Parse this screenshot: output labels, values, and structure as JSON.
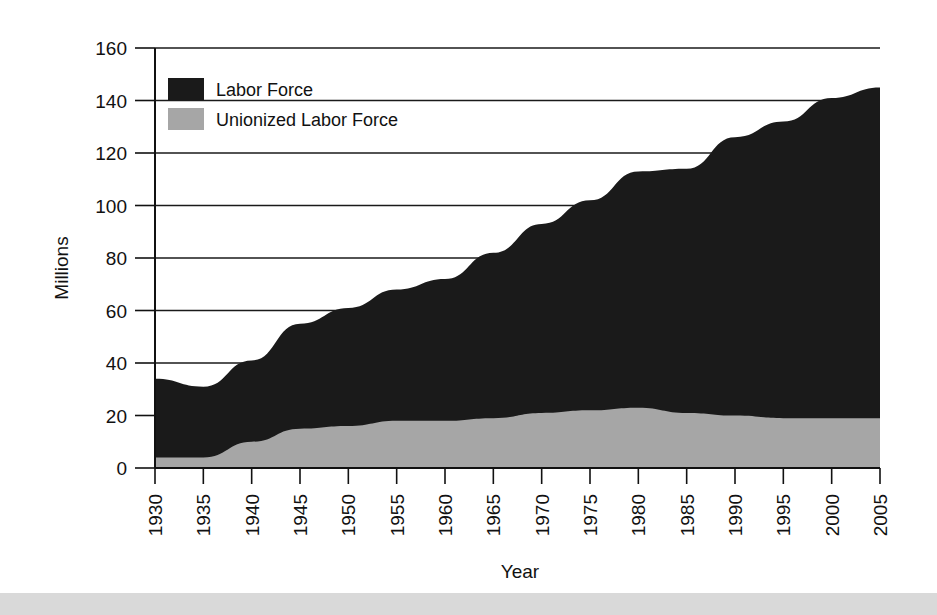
{
  "chart_data": {
    "type": "area",
    "title": "",
    "xlabel": "Year",
    "ylabel": "Millions",
    "x": [
      1930,
      1935,
      1940,
      1945,
      1950,
      1955,
      1960,
      1965,
      1970,
      1975,
      1980,
      1985,
      1990,
      1995,
      2000,
      2005
    ],
    "categories": [
      "1930",
      "1935",
      "1940",
      "1945",
      "1950",
      "1955",
      "1960",
      "1965",
      "1970",
      "1975",
      "1980",
      "1985",
      "1990",
      "1995",
      "2000",
      "2005"
    ],
    "series": [
      {
        "name": "Labor Force",
        "color": "#1a1a1a",
        "values": [
          34,
          31,
          41,
          55,
          61,
          68,
          72,
          82,
          93,
          102,
          113,
          114,
          126,
          132,
          141,
          145
        ]
      },
      {
        "name": "Unionized Labor Force",
        "color": "#a6a6a6",
        "values": [
          4,
          4,
          10,
          15,
          16,
          18,
          18,
          19,
          21,
          22,
          23,
          21,
          20,
          19,
          19,
          19
        ]
      }
    ],
    "xlim": [
      1930,
      2005
    ],
    "ylim": [
      0,
      160
    ],
    "ytick_step": 20,
    "yticks": [
      "0",
      "20",
      "40",
      "60",
      "80",
      "100",
      "120",
      "140",
      "160"
    ],
    "xticks": [
      "1930",
      "1935",
      "1940",
      "1945",
      "1950",
      "1955",
      "1960",
      "1965",
      "1970",
      "1975",
      "1980",
      "1985",
      "1990",
      "1995",
      "2000",
      "2005"
    ],
    "grid": true,
    "grid_axis": "y",
    "legend_position": "top-left",
    "stacked": true
  },
  "legend": {
    "entries": [
      {
        "label": "Labor Force",
        "swatch": "#1a1a1a"
      },
      {
        "label": "Unionized Labor Force",
        "swatch": "#a6a6a6"
      }
    ]
  },
  "axes": {
    "y_title": "Millions",
    "x_title": "Year"
  }
}
